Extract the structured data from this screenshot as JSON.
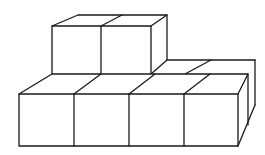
{
  "diagram": {
    "title": "",
    "colors": {
      "stroke": "#1a1a1a",
      "background": "#ffffff"
    },
    "layers": [
      {
        "name": "bottom-front-row",
        "cubes": 4
      },
      {
        "name": "bottom-back-row-right",
        "cubes": 2
      },
      {
        "name": "top-row",
        "cubes": 2
      }
    ],
    "total_visible_cubes": 8
  }
}
